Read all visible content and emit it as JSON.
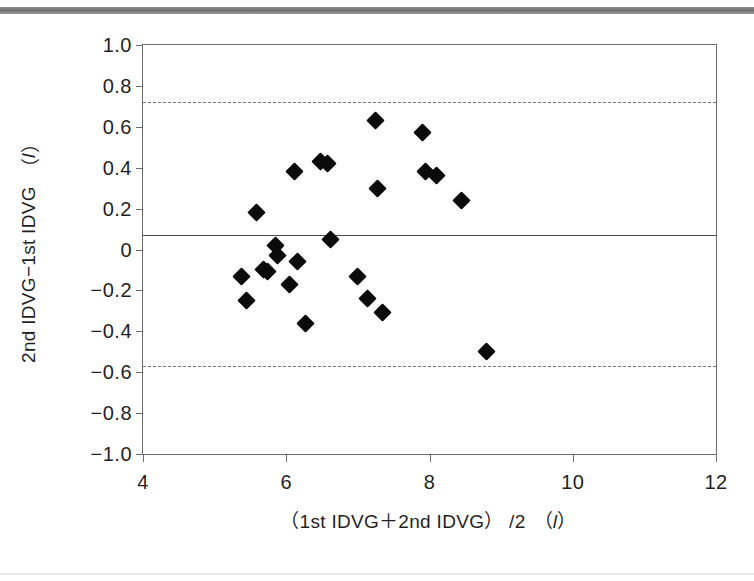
{
  "figure": {
    "kind": "bland-altman-scatter",
    "background_color": "#ffffff",
    "marker_color": "#0b0b0b",
    "axis_color": "#6b6b6b",
    "top_rule_color": "#6f6f6f"
  },
  "axis_titles": {
    "y_main": "2nd IDVG−1st IDVG",
    "y_unit_open": "（",
    "y_unit": "l",
    "y_unit_close": "）",
    "x_main": "（1st IDVG＋2nd IDVG） /2",
    "x_unit_open": "（",
    "x_unit": "l",
    "x_unit_close": "）"
  },
  "chart_data": {
    "type": "scatter",
    "title": "",
    "subtitle": "",
    "xlabel": "（1st IDVG＋2nd IDVG） /2 （l）",
    "ylabel": "2nd IDVG−1st IDVG （l）",
    "xlim": [
      4,
      12
    ],
    "ylim": [
      -1.0,
      1.0
    ],
    "xticks": [
      4,
      6,
      8,
      10,
      12
    ],
    "xtick_labels": [
      "4",
      "6",
      "8",
      "10",
      "12"
    ],
    "yticks": [
      1.0,
      0.8,
      0.6,
      0.4,
      0.2,
      0,
      -0.2,
      -0.4,
      -0.6,
      -0.8,
      -1.0
    ],
    "ytick_labels": [
      "1.0",
      "0.8",
      "0.6",
      "0.4",
      "0.2",
      "0",
      "−0.2",
      "−0.4",
      "−0.6",
      "−0.8",
      "−1.0"
    ],
    "grid": false,
    "legend": null,
    "marker": "filled-diamond",
    "reference_lines": [
      {
        "name": "upper-limit-of-agreement",
        "value": 0.72,
        "style": "dashed"
      },
      {
        "name": "mean-difference",
        "value": 0.07,
        "style": "solid"
      },
      {
        "name": "lower-limit-of-agreement",
        "value": -0.57,
        "style": "dashed"
      }
    ],
    "points": [
      {
        "x": 5.38,
        "y": -0.13
      },
      {
        "x": 5.45,
        "y": -0.25
      },
      {
        "x": 5.58,
        "y": 0.18
      },
      {
        "x": 5.68,
        "y": -0.1
      },
      {
        "x": 5.74,
        "y": -0.11
      },
      {
        "x": 5.85,
        "y": 0.02
      },
      {
        "x": 5.88,
        "y": -0.03
      },
      {
        "x": 6.05,
        "y": -0.17
      },
      {
        "x": 6.12,
        "y": 0.38
      },
      {
        "x": 6.16,
        "y": -0.06
      },
      {
        "x": 6.27,
        "y": -0.36
      },
      {
        "x": 6.48,
        "y": 0.43
      },
      {
        "x": 6.58,
        "y": 0.42
      },
      {
        "x": 6.62,
        "y": 0.05
      },
      {
        "x": 7.0,
        "y": -0.13
      },
      {
        "x": 7.13,
        "y": -0.24
      },
      {
        "x": 7.25,
        "y": 0.63
      },
      {
        "x": 7.28,
        "y": 0.3
      },
      {
        "x": 7.34,
        "y": -0.31
      },
      {
        "x": 7.9,
        "y": 0.57
      },
      {
        "x": 7.95,
        "y": 0.38
      },
      {
        "x": 8.1,
        "y": 0.36
      },
      {
        "x": 8.45,
        "y": 0.24
      },
      {
        "x": 8.79,
        "y": -0.5
      }
    ]
  }
}
